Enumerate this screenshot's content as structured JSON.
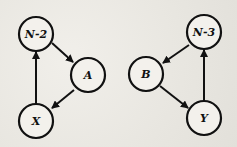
{
  "diagram": {
    "type": "directed-graph",
    "colors": {
      "background": "#ebe9e4",
      "stroke": "#111111",
      "node_fill": "#f3f1ec"
    },
    "graphs": [
      {
        "name": "left-cycle",
        "nodes": [
          {
            "id": "N-2",
            "label": "N-2",
            "cx": 36,
            "cy": 34
          },
          {
            "id": "A",
            "label": "A",
            "cx": 88,
            "cy": 75
          },
          {
            "id": "X",
            "label": "X",
            "cx": 36,
            "cy": 121
          }
        ],
        "edges": [
          {
            "from": "N-2",
            "to": "A"
          },
          {
            "from": "A",
            "to": "X"
          },
          {
            "from": "X",
            "to": "N-2"
          }
        ]
      },
      {
        "name": "right-cycle",
        "nodes": [
          {
            "id": "N-3",
            "label": "N-3",
            "cx": 204,
            "cy": 32
          },
          {
            "id": "B",
            "label": "B",
            "cx": 146,
            "cy": 74
          },
          {
            "id": "Y",
            "label": "Y",
            "cx": 204,
            "cy": 118
          }
        ],
        "edges": [
          {
            "from": "N-3",
            "to": "B"
          },
          {
            "from": "B",
            "to": "Y"
          },
          {
            "from": "Y",
            "to": "N-3"
          }
        ]
      }
    ]
  }
}
